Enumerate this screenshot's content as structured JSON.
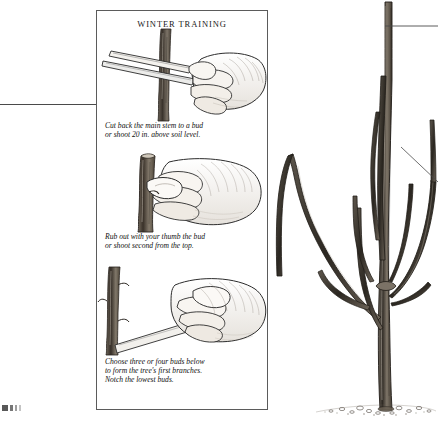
{
  "figure": {
    "panel_title": "WINTER TRAINING",
    "steps": [
      {
        "id": "step-1",
        "illustration": "hand-with-pruning-shears-cutting-stem-icon",
        "caption_lines": [
          "Cut back the main stem to a bud",
          "or shoot 20 in. above soil level."
        ]
      },
      {
        "id": "step-2",
        "illustration": "hand-rubbing-out-bud-with-thumb-icon",
        "caption_lines": [
          "Rub out with your thumb the bud",
          "or shoot second from the top."
        ]
      },
      {
        "id": "step-3",
        "illustration": "hand-with-knife-notching-stem-icon",
        "caption_lines": [
          "Choose three or four buds below",
          "to form the tree's first branches.",
          "Notch the lowest buds."
        ]
      }
    ],
    "tree_illustration": {
      "name": "young-tree-with-branches-illustration",
      "leader_lines": 2
    },
    "colors": {
      "ink": "#1a1a1a",
      "frame": "#5b5b5b",
      "rule": "#4a4a4a",
      "paper": "#ffffff"
    }
  }
}
